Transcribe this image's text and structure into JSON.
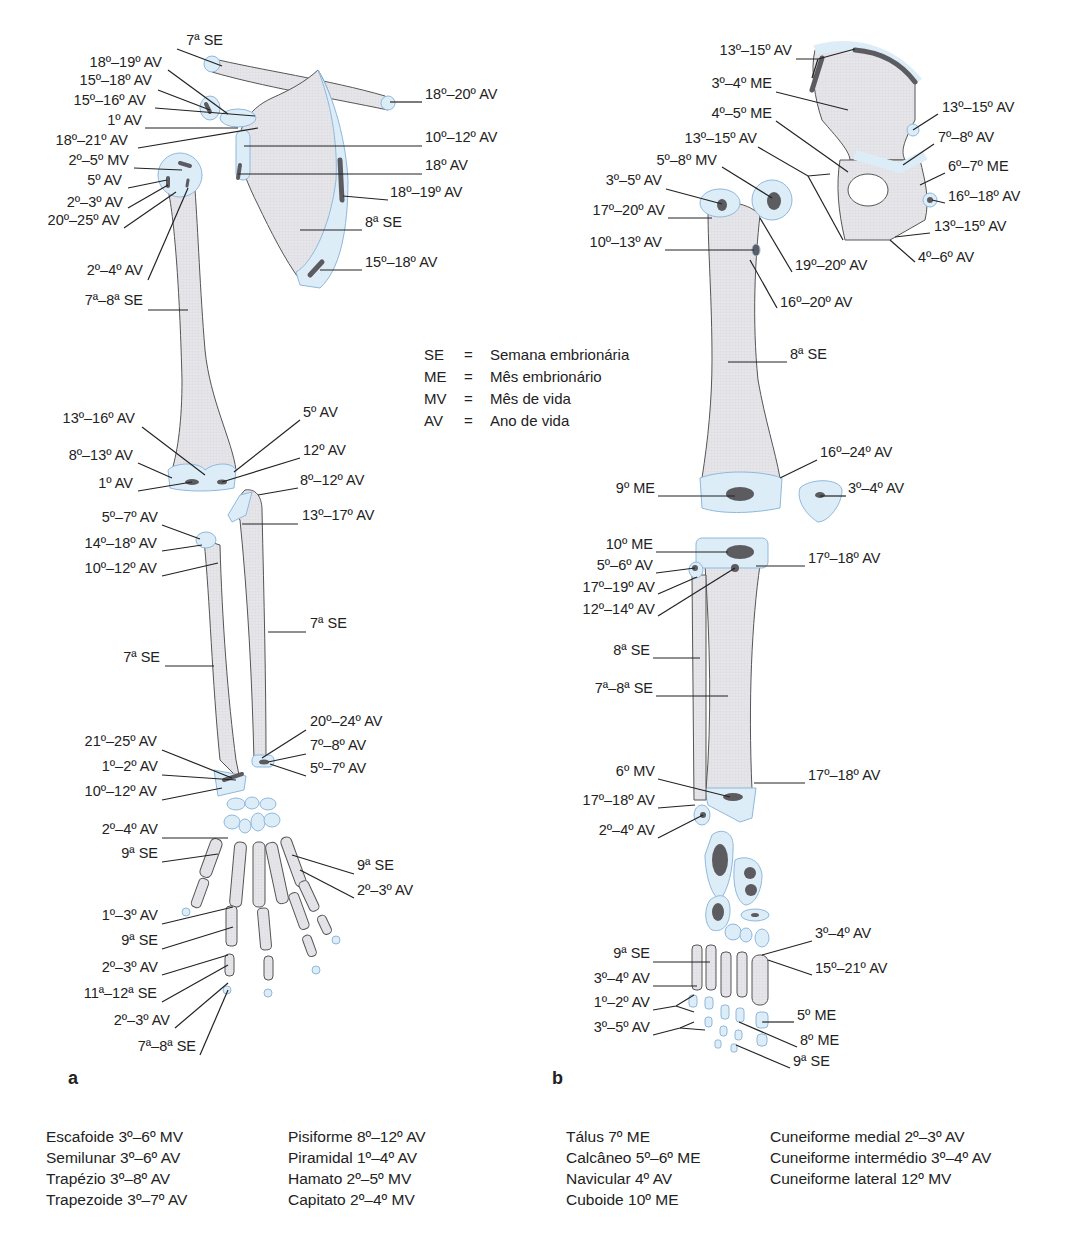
{
  "legend": [
    {
      "abbr": "SE",
      "eq": "=",
      "meaning": "Semana embrionária"
    },
    {
      "abbr": "ME",
      "eq": "=",
      "meaning": "Mês embrionário"
    },
    {
      "abbr": "MV",
      "eq": "=",
      "meaning": "Mês de vida"
    },
    {
      "abbr": "AV",
      "eq": "=",
      "meaning": "Ano de vida"
    }
  ],
  "panels": {
    "a": "a",
    "b": "b"
  },
  "labels_a": [
    {
      "id": "a1",
      "text": "7ª SE",
      "x": 163,
      "y": 40,
      "align": "r",
      "w": 60
    },
    {
      "id": "a2",
      "text": "18º–19º AV",
      "x": 80,
      "y": 62,
      "align": "r",
      "w": 82
    },
    {
      "id": "a3",
      "text": "15º–18º AV",
      "x": 70,
      "y": 80,
      "align": "r",
      "w": 82
    },
    {
      "id": "a4",
      "text": "15º–16º AV",
      "x": 64,
      "y": 100,
      "align": "r",
      "w": 82
    },
    {
      "id": "a5",
      "text": "1º AV",
      "x": 80,
      "y": 120,
      "align": "r",
      "w": 62
    },
    {
      "id": "a6",
      "text": "18º–21º AV",
      "x": 46,
      "y": 140,
      "align": "r",
      "w": 82
    },
    {
      "id": "a7",
      "text": "2º–5º MV",
      "x": 54,
      "y": 160,
      "align": "r",
      "w": 75
    },
    {
      "id": "a8",
      "text": "5º AV",
      "x": 60,
      "y": 180,
      "align": "r",
      "w": 62
    },
    {
      "id": "a9",
      "text": "2º–3º AV",
      "x": 48,
      "y": 202,
      "align": "r",
      "w": 75
    },
    {
      "id": "a10",
      "text": "20º–25º AV",
      "x": 30,
      "y": 220,
      "align": "r",
      "w": 90
    },
    {
      "id": "a11",
      "text": "2º–4º AV",
      "x": 68,
      "y": 270,
      "align": "r",
      "w": 75
    },
    {
      "id": "a12",
      "text": "7ª–8ª SE",
      "x": 68,
      "y": 300,
      "align": "r",
      "w": 75
    },
    {
      "id": "a13",
      "text": "18º–20º AV",
      "x": 425,
      "y": 94,
      "align": "l"
    },
    {
      "id": "a14",
      "text": "10º–12º AV",
      "x": 425,
      "y": 137,
      "align": "l"
    },
    {
      "id": "a15",
      "text": "18º AV",
      "x": 425,
      "y": 165,
      "align": "l"
    },
    {
      "id": "a16",
      "text": "18º–19º AV",
      "x": 390,
      "y": 192,
      "align": "l"
    },
    {
      "id": "a17",
      "text": "8ª SE",
      "x": 365,
      "y": 222,
      "align": "l"
    },
    {
      "id": "a18",
      "text": "15º–18º AV",
      "x": 365,
      "y": 262,
      "align": "l"
    },
    {
      "id": "a19",
      "text": "13º–16º AV",
      "x": 50,
      "y": 418,
      "align": "r",
      "w": 85
    },
    {
      "id": "a20",
      "text": "8º–13º AV",
      "x": 58,
      "y": 455,
      "align": "r",
      "w": 75
    },
    {
      "id": "a21",
      "text": "1º AV",
      "x": 78,
      "y": 483,
      "align": "r",
      "w": 55
    },
    {
      "id": "a22",
      "text": "5º AV",
      "x": 303,
      "y": 412,
      "align": "l"
    },
    {
      "id": "a23",
      "text": "12º AV",
      "x": 303,
      "y": 450,
      "align": "l"
    },
    {
      "id": "a24",
      "text": "8º–12º AV",
      "x": 300,
      "y": 480,
      "align": "l"
    },
    {
      "id": "a25",
      "text": "13º–17º AV",
      "x": 302,
      "y": 515,
      "align": "l"
    },
    {
      "id": "a26",
      "text": "5º–7º AV",
      "x": 83,
      "y": 517,
      "align": "r",
      "w": 75
    },
    {
      "id": "a27",
      "text": "14º–18º AV",
      "x": 65,
      "y": 543,
      "align": "r",
      "w": 92
    },
    {
      "id": "a28",
      "text": "10º–12º AV",
      "x": 65,
      "y": 568,
      "align": "r",
      "w": 92
    },
    {
      "id": "a29",
      "text": "7ª SE",
      "x": 310,
      "y": 623,
      "align": "l"
    },
    {
      "id": "a30",
      "text": "7ª SE",
      "x": 110,
      "y": 657,
      "align": "r",
      "w": 50
    },
    {
      "id": "a31",
      "text": "20º–24º AV",
      "x": 310,
      "y": 721,
      "align": "l"
    },
    {
      "id": "a32",
      "text": "7º–8º AV",
      "x": 310,
      "y": 745,
      "align": "l"
    },
    {
      "id": "a33",
      "text": "5º–7º AV",
      "x": 310,
      "y": 768,
      "align": "l"
    },
    {
      "id": "a34",
      "text": "21º–25º AV",
      "x": 65,
      "y": 741,
      "align": "r",
      "w": 92
    },
    {
      "id": "a35",
      "text": "1º–2º AV",
      "x": 78,
      "y": 766,
      "align": "r",
      "w": 80
    },
    {
      "id": "a36",
      "text": "10º–12º AV",
      "x": 65,
      "y": 791,
      "align": "r",
      "w": 92
    },
    {
      "id": "a37",
      "text": "2º–4º AV",
      "x": 78,
      "y": 829,
      "align": "r",
      "w": 80
    },
    {
      "id": "a38",
      "text": "9ª SE",
      "x": 108,
      "y": 853,
      "align": "r",
      "w": 50
    },
    {
      "id": "a39",
      "text": "9ª SE",
      "x": 357,
      "y": 865,
      "align": "l"
    },
    {
      "id": "a40",
      "text": "2º–3º AV",
      "x": 357,
      "y": 890,
      "align": "l"
    },
    {
      "id": "a41",
      "text": "1º–3º AV",
      "x": 78,
      "y": 915,
      "align": "r",
      "w": 80
    },
    {
      "id": "a42",
      "text": "9ª SE",
      "x": 108,
      "y": 940,
      "align": "r",
      "w": 50
    },
    {
      "id": "a43",
      "text": "2º–3º AV",
      "x": 78,
      "y": 967,
      "align": "r",
      "w": 80
    },
    {
      "id": "a44",
      "text": "11ª–12ª SE",
      "x": 65,
      "y": 993,
      "align": "r",
      "w": 92
    },
    {
      "id": "a45",
      "text": "2º–3º AV",
      "x": 90,
      "y": 1020,
      "align": "r",
      "w": 80
    },
    {
      "id": "a46",
      "text": "7ª–8ª SE",
      "x": 118,
      "y": 1046,
      "align": "r",
      "w": 78
    }
  ],
  "labels_b": [
    {
      "id": "b1",
      "text": "13º–15º AV",
      "x": 700,
      "y": 50,
      "align": "r",
      "w": 92
    },
    {
      "id": "b2",
      "text": "3º–4º ME",
      "x": 690,
      "y": 83,
      "align": "r",
      "w": 82
    },
    {
      "id": "b3",
      "text": "4º–5º ME",
      "x": 690,
      "y": 113,
      "align": "r",
      "w": 82
    },
    {
      "id": "b4",
      "text": "13º–15º AV",
      "x": 665,
      "y": 138,
      "align": "r",
      "w": 92
    },
    {
      "id": "b5",
      "text": "5º–8º MV",
      "x": 635,
      "y": 160,
      "align": "r",
      "w": 82
    },
    {
      "id": "b6",
      "text": "3º–5º AV",
      "x": 580,
      "y": 180,
      "align": "r",
      "w": 82
    },
    {
      "id": "b7",
      "text": "17º–20º AV",
      "x": 565,
      "y": 210,
      "align": "r",
      "w": 100
    },
    {
      "id": "b8",
      "text": "10º–13º AV",
      "x": 570,
      "y": 242,
      "align": "r",
      "w": 92
    },
    {
      "id": "b9",
      "text": "13º–15º AV",
      "x": 942,
      "y": 107,
      "align": "l"
    },
    {
      "id": "b10",
      "text": "7º–8º AV",
      "x": 938,
      "y": 137,
      "align": "l"
    },
    {
      "id": "b11",
      "text": "6º–7º ME",
      "x": 948,
      "y": 166,
      "align": "l"
    },
    {
      "id": "b12",
      "text": "16º–18º AV",
      "x": 948,
      "y": 196,
      "align": "l"
    },
    {
      "id": "b13",
      "text": "13º–15º AV",
      "x": 934,
      "y": 226,
      "align": "l"
    },
    {
      "id": "b14",
      "text": "4º–6º AV",
      "x": 918,
      "y": 257,
      "align": "l"
    },
    {
      "id": "b15",
      "text": "19º–20º AV",
      "x": 795,
      "y": 265,
      "align": "l"
    },
    {
      "id": "b16",
      "text": "16º–20º AV",
      "x": 780,
      "y": 302,
      "align": "l"
    },
    {
      "id": "b17",
      "text": "8ª SE",
      "x": 790,
      "y": 354,
      "align": "l"
    },
    {
      "id": "b18",
      "text": "16º–24º AV",
      "x": 820,
      "y": 452,
      "align": "l"
    },
    {
      "id": "b19",
      "text": "9º ME",
      "x": 595,
      "y": 488,
      "align": "r",
      "w": 60
    },
    {
      "id": "b20",
      "text": "3º–4º AV",
      "x": 848,
      "y": 488,
      "align": "l"
    },
    {
      "id": "b21",
      "text": "10º ME",
      "x": 595,
      "y": 544,
      "align": "r",
      "w": 58
    },
    {
      "id": "b22",
      "text": "5º–6º AV",
      "x": 575,
      "y": 565,
      "align": "r",
      "w": 78
    },
    {
      "id": "b23",
      "text": "17º–19º AV",
      "x": 565,
      "y": 587,
      "align": "r",
      "w": 90
    },
    {
      "id": "b24",
      "text": "12º–14º AV",
      "x": 565,
      "y": 609,
      "align": "r",
      "w": 90
    },
    {
      "id": "b25",
      "text": "17º–18º AV",
      "x": 808,
      "y": 558,
      "align": "l"
    },
    {
      "id": "b26",
      "text": "8ª SE",
      "x": 600,
      "y": 650,
      "align": "r",
      "w": 50
    },
    {
      "id": "b27",
      "text": "7ª–8ª SE",
      "x": 575,
      "y": 688,
      "align": "r",
      "w": 78
    },
    {
      "id": "b28",
      "text": "6º MV",
      "x": 600,
      "y": 771,
      "align": "r",
      "w": 55
    },
    {
      "id": "b29",
      "text": "17º–18º AV",
      "x": 808,
      "y": 775,
      "align": "l"
    },
    {
      "id": "b30",
      "text": "17º–18º AV",
      "x": 565,
      "y": 800,
      "align": "r",
      "w": 90
    },
    {
      "id": "b31",
      "text": "2º–4º AV",
      "x": 575,
      "y": 830,
      "align": "r",
      "w": 80
    },
    {
      "id": "b32",
      "text": "3º–4º AV",
      "x": 815,
      "y": 933,
      "align": "l"
    },
    {
      "id": "b33",
      "text": "15º–21º AV",
      "x": 815,
      "y": 968,
      "align": "l"
    },
    {
      "id": "b34",
      "text": "9ª SE",
      "x": 600,
      "y": 953,
      "align": "r",
      "w": 50
    },
    {
      "id": "b35",
      "text": "3º–4º AV",
      "x": 570,
      "y": 978,
      "align": "r",
      "w": 80
    },
    {
      "id": "b36",
      "text": "1º–2º AV",
      "x": 570,
      "y": 1002,
      "align": "r",
      "w": 80
    },
    {
      "id": "b37",
      "text": "3º–5º AV",
      "x": 570,
      "y": 1027,
      "align": "r",
      "w": 80
    },
    {
      "id": "b38",
      "text": "5º ME",
      "x": 797,
      "y": 1015,
      "align": "l"
    },
    {
      "id": "b39",
      "text": "8º ME",
      "x": 800,
      "y": 1040,
      "align": "l"
    },
    {
      "id": "b40",
      "text": "9ª SE",
      "x": 793,
      "y": 1061,
      "align": "l"
    }
  ],
  "bottom_lists": {
    "hand_col1": [
      "Escafoide 3º–6º MV",
      "Semilunar 3º–6º AV",
      "Trapézio 3º–8º AV",
      "Trapezoide 3º–7º AV"
    ],
    "hand_col2": [
      "Pisiforme 8º–12º AV",
      "Piramidal 1º–4º AV",
      "Hamato 2º–5º MV",
      "Capitato 2º–4º MV"
    ],
    "foot_col1": [
      "Tálus 7º ME",
      "Calcâneo 5º–6º ME",
      "Navicular 4º AV",
      "Cuboide 10º ME"
    ],
    "foot_col2": [
      "Cuneiforme medial 2º–3º AV",
      "Cuneiforme intermédio 3º–4º AV",
      "Cuneiforme lateral 12º MV"
    ]
  },
  "colors": {
    "bone": "#e4e4e8",
    "cartilage": "#dcedf8",
    "cartilage_edge": "#8fb8dc",
    "ossification_center": "#5c5c60",
    "line": "#222222"
  }
}
